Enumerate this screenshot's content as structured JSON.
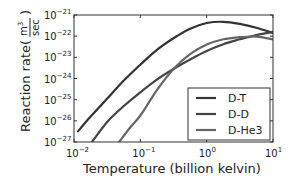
{
  "chart_data": {
    "type": "line",
    "title": "",
    "xlabel": "Temperature  (billion kelvin)",
    "ylabel": "Reaction rate",
    "ylabel_unit_numerator": "m3",
    "ylabel_unit_denominator": "sec",
    "xscale": "log",
    "yscale": "log",
    "xlim": [
      0.01,
      10
    ],
    "ylim": [
      1e-27,
      1e-21
    ],
    "x_ticks": [
      {
        "base": "10",
        "exp": "−2",
        "value": 0.01
      },
      {
        "base": "10",
        "exp": "−1",
        "value": 0.1
      },
      {
        "base": "10",
        "exp": "0",
        "value": 1
      },
      {
        "base": "10",
        "exp": "1",
        "value": 10
      }
    ],
    "y_ticks": [
      {
        "base": "10",
        "exp": "−21",
        "value": 1e-21
      },
      {
        "base": "10",
        "exp": "−22",
        "value": 1e-22
      },
      {
        "base": "10",
        "exp": "−23",
        "value": 1e-23
      },
      {
        "base": "10",
        "exp": "−24",
        "value": 1e-24
      },
      {
        "base": "10",
        "exp": "−25",
        "value": 1e-25
      },
      {
        "base": "10",
        "exp": "−26",
        "value": 1e-26
      },
      {
        "base": "10",
        "exp": "−27",
        "value": 1e-27
      }
    ],
    "grid": false,
    "legend_position": "lower right",
    "series": [
      {
        "name": "D-T",
        "color": "#333333",
        "log_x": [
          -1.94,
          -1.75,
          -1.5,
          -1.25,
          -1.0,
          -0.75,
          -0.5,
          -0.25,
          0.0,
          0.25,
          0.5,
          0.75,
          1.0
        ],
        "log_y": [
          -26.5,
          -25.8,
          -24.95,
          -24.1,
          -23.35,
          -22.65,
          -22.1,
          -21.65,
          -21.38,
          -21.32,
          -21.42,
          -21.6,
          -21.85
        ]
      },
      {
        "name": "D-D",
        "color": "#444444",
        "log_x": [
          -1.73,
          -1.5,
          -1.25,
          -1.0,
          -0.75,
          -0.5,
          -0.25,
          0.0,
          0.25,
          0.5,
          0.75,
          1.0
        ],
        "log_y": [
          -27.0,
          -26.05,
          -25.3,
          -24.65,
          -24.05,
          -23.55,
          -23.1,
          -22.7,
          -22.38,
          -22.15,
          -21.95,
          -21.8
        ]
      },
      {
        "name": "D-He3",
        "color": "#666666",
        "log_x": [
          -1.32,
          -1.15,
          -1.0,
          -0.75,
          -0.5,
          -0.25,
          0.0,
          0.25,
          0.5,
          0.75,
          1.0
        ],
        "log_y": [
          -27.0,
          -26.3,
          -25.75,
          -24.55,
          -23.55,
          -22.85,
          -22.4,
          -22.15,
          -22.05,
          -22.02,
          -22.15
        ]
      }
    ]
  }
}
